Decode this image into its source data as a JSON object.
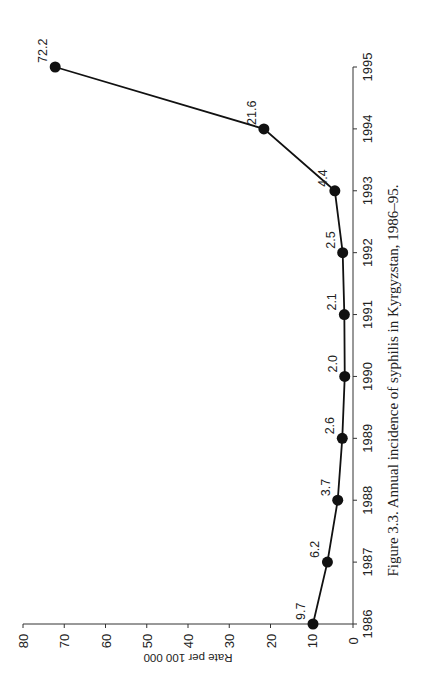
{
  "chart_data": {
    "type": "line",
    "title": "Figure 3.3. Annual incidence of syphilis in Kyrgyzstan, 1986–95.",
    "xlabel": "",
    "ylabel": "Rate per 100 000",
    "categories": [
      "1986",
      "1987",
      "1988",
      "1989",
      "1990",
      "1991",
      "1992",
      "1993",
      "1994",
      "1995"
    ],
    "series": [
      {
        "name": "Syphilis incidence",
        "values": [
          9.7,
          6.2,
          3.7,
          2.6,
          2.0,
          2.1,
          2.5,
          4.4,
          21.6,
          72.2
        ]
      }
    ],
    "data_labels": [
      "9.7",
      "6.2",
      "3.7",
      "2.6",
      "2.0",
      "2.1",
      "2.5",
      "4.4",
      "21.6",
      "72.2"
    ],
    "ylim": [
      0,
      80
    ],
    "yticks": [
      "0",
      "10",
      "20",
      "30",
      "40",
      "50",
      "60",
      "70",
      "80"
    ],
    "grid": false,
    "legend": null,
    "orientation": "rotated 90° counter-clockwise on page",
    "marker": "filled circle",
    "line_color": "#111111"
  },
  "caption": "Figure 3.3. Annual incidence of syphilis in Kyrgyzstan, 1986–95."
}
